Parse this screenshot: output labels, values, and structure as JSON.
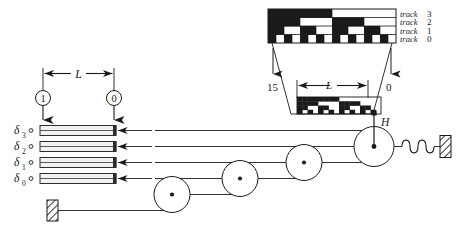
{
  "figure": {
    "type": "mechanical-diagram",
    "colors": {
      "ink": "#1a1a1a",
      "paper": "#ffffff",
      "bar_fill": "#f2f2f2",
      "cap_fill": "#2b2b2b"
    }
  },
  "code_strip": {
    "caption": "4-bit binary code pattern, 16 columns",
    "bits_per_column": 4,
    "column_count": 16,
    "track_labels": [
      {
        "word": "track",
        "number": "3"
      },
      {
        "word": "track",
        "number": "2"
      },
      {
        "word": "track",
        "number": "1"
      },
      {
        "word": "track",
        "number": "0"
      }
    ],
    "track_order_top_to_bottom": [
      3,
      2,
      1,
      0
    ],
    "columns_left_to_right": [
      {
        "value": "15",
        "bits": {
          "3": 1,
          "2": 1,
          "1": 1,
          "0": 1
        }
      },
      {
        "value": "14",
        "bits": {
          "3": 1,
          "2": 1,
          "1": 1,
          "0": 0
        }
      },
      {
        "value": "13",
        "bits": {
          "3": 1,
          "2": 1,
          "1": 0,
          "0": 1
        }
      },
      {
        "value": "12",
        "bits": {
          "3": 1,
          "2": 1,
          "1": 0,
          "0": 0
        }
      },
      {
        "value": "11",
        "bits": {
          "3": 1,
          "2": 0,
          "1": 1,
          "0": 1
        }
      },
      {
        "value": "10",
        "bits": {
          "3": 1,
          "2": 0,
          "1": 1,
          "0": 0
        }
      },
      {
        "value": "9",
        "bits": {
          "3": 1,
          "2": 0,
          "1": 0,
          "0": 1
        }
      },
      {
        "value": "8",
        "bits": {
          "3": 1,
          "2": 0,
          "1": 0,
          "0": 0
        }
      },
      {
        "value": "7",
        "bits": {
          "3": 0,
          "2": 1,
          "1": 1,
          "0": 1
        }
      },
      {
        "value": "6",
        "bits": {
          "3": 0,
          "2": 1,
          "1": 1,
          "0": 0
        }
      },
      {
        "value": "5",
        "bits": {
          "3": 0,
          "2": 1,
          "1": 0,
          "0": 1
        }
      },
      {
        "value": "4",
        "bits": {
          "3": 0,
          "2": 1,
          "1": 0,
          "0": 0
        }
      },
      {
        "value": "3",
        "bits": {
          "3": 0,
          "2": 0,
          "1": 1,
          "0": 1
        }
      },
      {
        "value": "2",
        "bits": {
          "3": 0,
          "2": 0,
          "1": 1,
          "0": 0
        }
      },
      {
        "value": "1",
        "bits": {
          "3": 0,
          "2": 0,
          "1": 0,
          "0": 1
        }
      },
      {
        "value": "0",
        "bits": {
          "3": 0,
          "2": 0,
          "1": 0,
          "0": 0
        }
      }
    ]
  },
  "callout": {
    "left_index_label": "15",
    "right_index_label": "0",
    "dimension_label": "L"
  },
  "readout": {
    "top_dimension_label": "L",
    "marker_left_label": "1",
    "marker_right_label": "0",
    "channels": [
      {
        "label": "δ",
        "subscript": "3"
      },
      {
        "label": "δ",
        "subscript": "2"
      },
      {
        "label": "δ",
        "subscript": "1"
      },
      {
        "label": "δ",
        "subscript": "0"
      }
    ]
  },
  "mechanism": {
    "head_label": "H",
    "pulley_count": 4,
    "spring": {
      "name": "coil-spring",
      "turns": 4
    },
    "anchors": [
      {
        "name": "right-wall-anchor"
      },
      {
        "name": "bottom-left-wall-anchor"
      }
    ]
  }
}
